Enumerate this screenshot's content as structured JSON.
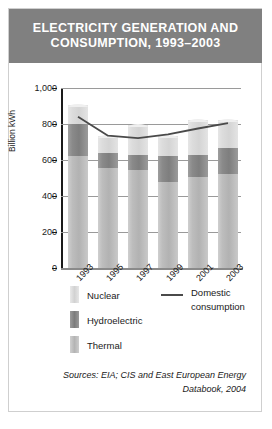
{
  "title": {
    "line1": "ELECTRICITY GENERATION AND",
    "line2": "CONSUMPTION, 1993–2003"
  },
  "sources": {
    "line1": "Sources: EIA; CIS and East European Energy",
    "line2": "Databook, 2004"
  },
  "legend": {
    "nuclear": "Nuclear",
    "hydroelectric": "Hydroelectric",
    "thermal": "Thermal",
    "domestic_line1": "Domestic",
    "domestic_line2": "consumption"
  },
  "colors": {
    "title_band": "#808080",
    "thermal": "#bdbdbd",
    "hydroelectric": "#828282",
    "nuclear": "#dcdcdc",
    "line": "#4a4a4a",
    "grid": "#9a9a9a",
    "axis": "#1a1a1a"
  },
  "chart_data": {
    "type": "bar",
    "title": "ELECTRICITY GENERATION AND CONSUMPTION, 1993–2003",
    "xlabel": "",
    "ylabel": "Billion kWh",
    "ylim": [
      0,
      1000
    ],
    "yticks": [
      0,
      200,
      400,
      600,
      800,
      1000
    ],
    "ytick_labels": [
      "0",
      "200",
      "400",
      "600",
      "800",
      "1,000"
    ],
    "grid": true,
    "legend_position": "bottom",
    "stacked": true,
    "categories": [
      "1993",
      "1995",
      "1997",
      "1999",
      "2001",
      "2003"
    ],
    "series": [
      {
        "name": "Thermal",
        "values": [
          620,
          555,
          545,
          480,
          505,
          525
        ]
      },
      {
        "name": "Hydroelectric",
        "values": [
          180,
          85,
          85,
          140,
          125,
          140
        ]
      },
      {
        "name": "Nuclear",
        "values": [
          105,
          95,
          165,
          115,
          190,
          160
        ]
      }
    ],
    "overlay_series": [
      {
        "name": "Domestic consumption",
        "type": "line",
        "values": [
          840,
          735,
          722,
          742,
          775,
          805
        ]
      }
    ]
  }
}
